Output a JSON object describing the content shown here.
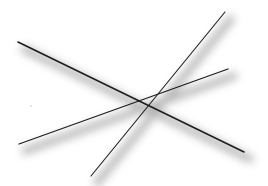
{
  "diagram": {
    "width": 268,
    "height": 186,
    "background": "#ffffff",
    "line_color": "#1e1e1e",
    "shadow_color": "#9a9a9a",
    "shadow_offset": [
      6,
      7
    ],
    "shadow_blur": 4,
    "lines": [
      {
        "name": "line-a",
        "x1": 18,
        "y1": 42,
        "x2": 244,
        "y2": 152,
        "width": 1.6
      },
      {
        "name": "line-b",
        "x1": 91,
        "y1": 176,
        "x2": 225,
        "y2": 12,
        "width": 1.1
      },
      {
        "name": "line-c",
        "x1": 19,
        "y1": 144,
        "x2": 228,
        "y2": 69,
        "width": 1.3
      }
    ],
    "intersection": {
      "x": 150,
      "y": 98
    },
    "specks": [
      {
        "x": 31,
        "y": 106,
        "r": 0.7,
        "color": "#b8b8b8"
      }
    ]
  }
}
